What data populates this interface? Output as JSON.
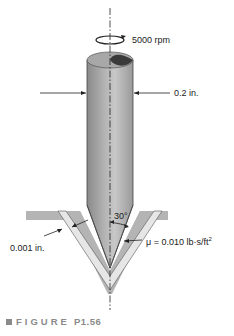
{
  "figure": {
    "labels": {
      "speed": "5000 rpm",
      "diameter": "0.2 in.",
      "angle": "30°",
      "gap": "0.001 in.",
      "viscosity": "μ = 0.010 lb·s/ft",
      "viscosity_exp": "2"
    },
    "caption": {
      "word": "FIGURE",
      "number": "P1.56"
    },
    "colors": {
      "shaft_light": "#c8c8c8",
      "shaft_dark": "#7a7a7a",
      "shaft_top": "#3a3a3a",
      "housing": "#b4b4b4",
      "film": "#e6e6e6",
      "caption": "#8a8a8a"
    }
  }
}
